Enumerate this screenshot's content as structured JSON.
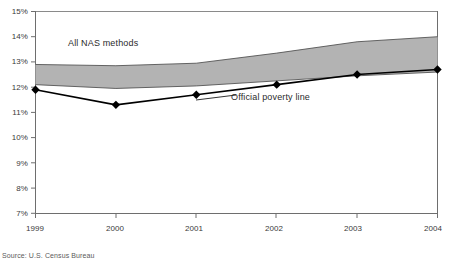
{
  "chart_data": {
    "type": "area",
    "title": "",
    "subtitle": "",
    "xlabel": "",
    "ylabel": "",
    "x": [
      1999,
      2000,
      2001,
      2002,
      2003,
      2004
    ],
    "xtick_labels": [
      "1999",
      "2000",
      "2001",
      "2002",
      "2003",
      "2004"
    ],
    "ytick_labels": [
      "15%",
      "14%",
      "13%",
      "12%",
      "11%",
      "10%",
      "9%",
      "8%",
      "7%"
    ],
    "ytick_values": [
      15,
      14,
      13,
      12,
      11,
      10,
      9,
      8,
      7
    ],
    "xlim": [
      1999,
      2004
    ],
    "ylim": [
      7,
      15
    ],
    "grid": false,
    "legend": "inline-annotations",
    "series": [
      {
        "name": "All NAS methods",
        "type": "band",
        "upper": [
          12.9,
          12.85,
          12.95,
          13.35,
          13.8,
          14.0
        ],
        "lower": [
          12.1,
          11.95,
          12.05,
          12.25,
          12.45,
          12.6
        ],
        "color": "#b3b3b3",
        "edge_color": "#555555"
      },
      {
        "name": "Official poverty line",
        "type": "line",
        "values": [
          11.9,
          11.3,
          11.7,
          12.1,
          12.5,
          12.7
        ],
        "color": "#000000",
        "marker": "diamond"
      }
    ],
    "annotations": [
      {
        "text": "All NAS methods",
        "x": 2000.0,
        "y": 14.05
      },
      {
        "text": "Official poverty line",
        "x": 2001.75,
        "y": 11.62
      }
    ],
    "source_note": "Source: U.S. Census Bureau"
  },
  "colors": {
    "band_fill": "#b3b3b3",
    "band_edge": "#555555",
    "line": "#000000",
    "axis": "#6e6e6e",
    "text": "#3a3a3a",
    "background": "#ffffff"
  }
}
